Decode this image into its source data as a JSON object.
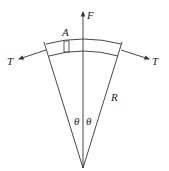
{
  "diagram": {
    "labels": {
      "force": "F",
      "tension_left": "T",
      "tension_right": "T",
      "element": "A",
      "radius": "R",
      "angle_left": "θ",
      "angle_right": "θ"
    },
    "colors": {
      "stroke": "#333333",
      "background": "#ffffff"
    }
  }
}
